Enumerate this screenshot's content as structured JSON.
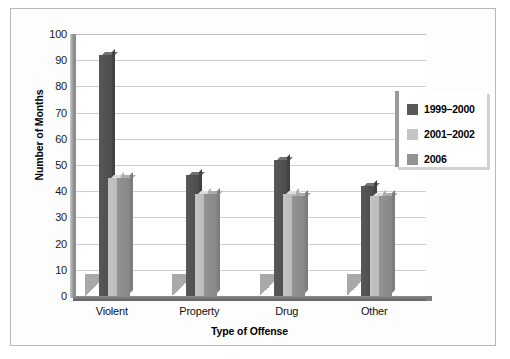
{
  "chart_data": {
    "type": "bar",
    "title": "",
    "xlabel": "Type of Offense",
    "ylabel": "Number of Months",
    "categories": [
      "Violent",
      "Property",
      "Drug",
      "Other"
    ],
    "series": [
      {
        "name": "1999–2000",
        "color": "#58585a",
        "values": [
          92,
          46,
          52,
          42
        ]
      },
      {
        "name": "2001–2002",
        "color": "#c4c4c4",
        "values": [
          45,
          39,
          39,
          38
        ]
      },
      {
        "name": "2006",
        "color": "#939395",
        "values": [
          45,
          39,
          38,
          38
        ]
      }
    ],
    "ylim": [
      0,
      100
    ],
    "yticks": [
      0,
      10,
      20,
      30,
      40,
      50,
      60,
      70,
      80,
      90,
      100
    ],
    "ytick_labels": [
      "0",
      "10",
      "20",
      "30",
      "40",
      "50",
      "60",
      "70",
      "80",
      "90",
      "100"
    ],
    "grid": true,
    "grid_axis": "y",
    "legend_position": "right",
    "style": "3d-column",
    "background_color": "#ffffff",
    "gridline_color": "#cfcfcf",
    "axis_color": "#6a6a6a"
  }
}
